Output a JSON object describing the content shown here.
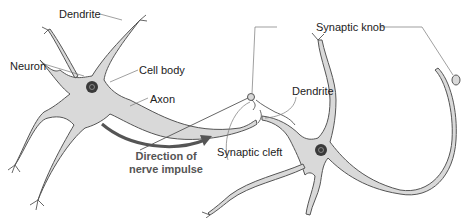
{
  "diagram": {
    "labels": {
      "dendrite_top": "Dendrite",
      "neuron": "Neuron",
      "cell_body": "Cell body",
      "axon": "Axon",
      "synaptic_knob": "Synaptic knob",
      "dendrite_right": "Dendrite",
      "synaptic_cleft": "Synaptic cleft",
      "direction_line1": "Direction of",
      "direction_line2": "nerve impulse"
    },
    "colors": {
      "cell_fill": "#d9d9d9",
      "outline": "#555555",
      "nucleus": "#3a3a3a",
      "arrow": "#555555",
      "leader_line": "#777777"
    }
  }
}
